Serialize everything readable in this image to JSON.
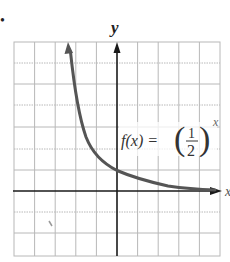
{
  "figure": {
    "function_label": "f(x) = (1/2)^x",
    "label_lhs": "f(x) =",
    "label_num": "1",
    "label_den": "2",
    "label_exp": "x",
    "y_axis_label": "y",
    "x_axis_label": "x",
    "bullet": "•"
  },
  "graph": {
    "type": "line",
    "title": "",
    "function": "(1/2)^x",
    "xlim": [
      -5,
      5
    ],
    "ylim": [
      -3,
      7
    ],
    "grid": true,
    "grid_step": 1,
    "y_intercept": 1,
    "horizontal_asymptote": "y = 0"
  },
  "colors": {
    "grid": "#b8b8b8",
    "axis": "#1a1a1a",
    "curve": "#555555",
    "text": "#222222"
  }
}
